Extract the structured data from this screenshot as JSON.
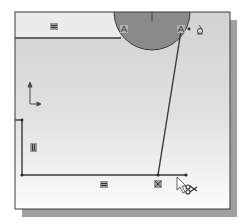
{
  "canvas": {
    "background_top": "#d4d4d4",
    "background_bottom": "#fbfbfb",
    "frame_color": "#3a3a3a",
    "shadow_color": "#9c9c9c",
    "sketch_line_color": "#3c3c3c",
    "circle_fill": "#8c8c8c"
  },
  "constraints": [
    {
      "type": "horizontal",
      "glyph": "=",
      "name": "horizontal-constraint-top"
    },
    {
      "type": "vertical",
      "glyph": "||",
      "name": "vertical-constraint-left"
    },
    {
      "type": "horizontal",
      "glyph": "=",
      "name": "horizontal-constraint-bottom"
    },
    {
      "type": "coincident",
      "glyph": "X",
      "name": "coincident-constraint-bottom"
    },
    {
      "type": "tangent",
      "glyph": "A",
      "name": "tangent-constraint-left"
    },
    {
      "type": "tangent",
      "glyph": "A",
      "name": "tangent-constraint-right"
    }
  ],
  "cursor": {
    "tool": "trim",
    "icon": "scissors-icon"
  },
  "origin": {
    "icon": "origin-axes-icon"
  }
}
